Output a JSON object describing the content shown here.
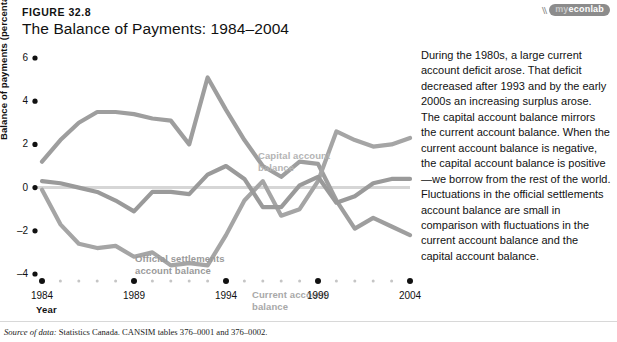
{
  "figure": {
    "number": "FIGURE 32.8",
    "title": "The Balance of Payments: 1984–2004"
  },
  "badge": {
    "mark": "\\\\\\\\",
    "prefix": "my",
    "word": "econlab"
  },
  "source": {
    "prefix": "Source of data:",
    "text": " Statistics Canada. CANSIM tables 376–0001 and 376–0002."
  },
  "side_text": "During the 1980s, a large current account deficit arose. That deficit decreased after 1993 and by the early 2000s an increasing surplus arose. The capital account balance mirrors the current account balance. When the current account balance is negative, the capital account balance is positive—we borrow from the rest of the world. Fluctuations in the official settlements account balance are small in comparison with fluctuations in the current account balance and the capital account balance.",
  "colors": {
    "capital": "#9e9e9e",
    "current": "#a5a5a5",
    "official": "#9a9a9a",
    "zero_line": "#d6d6d6",
    "tick_major": "#111111",
    "tick_minor": "#c5c5c5"
  },
  "chart_data": {
    "type": "line",
    "title": "The Balance of Payments: 1984–2004",
    "xlabel": "Year",
    "ylabel": "Balance of payments (percentage of GDP)",
    "xlim": [
      1984,
      2004
    ],
    "ylim": [
      -4,
      6
    ],
    "yticks": [
      6,
      4,
      2,
      0,
      -2,
      -4
    ],
    "xticks": [
      1984,
      1989,
      1994,
      1999,
      2004
    ],
    "grid": false,
    "legend": "inline-labels",
    "x": [
      1984,
      1985,
      1986,
      1987,
      1988,
      1989,
      1990,
      1991,
      1992,
      1993,
      1994,
      1995,
      1996,
      1997,
      1998,
      1999,
      2000,
      2001,
      2002,
      2003,
      2004
    ],
    "series": [
      {
        "name": "Capital account balance",
        "color": "#9e9e9e",
        "label_position": {
          "x": 258,
          "y": 106
        },
        "values": [
          1.2,
          2.2,
          3.0,
          3.5,
          3.5,
          3.4,
          3.2,
          3.1,
          2.0,
          5.1,
          3.6,
          2.2,
          1.0,
          0.5,
          1.2,
          1.1,
          -0.6,
          -1.9,
          -1.4,
          -1.8,
          -2.2
        ]
      },
      {
        "name": "Current account balance",
        "color": "#a5a5a5",
        "label_position": {
          "x": 252,
          "y": 245
        },
        "values": [
          -0.1,
          -1.7,
          -2.6,
          -2.8,
          -2.7,
          -3.2,
          -3.0,
          -3.6,
          -3.5,
          -3.6,
          -2.2,
          -0.6,
          0.3,
          -1.3,
          -1.0,
          0.3,
          2.6,
          2.2,
          1.9,
          2.0,
          2.3
        ]
      },
      {
        "name": "Official settlements account balance",
        "color": "#9a9a9a",
        "label_position": {
          "x": 135,
          "y": 209
        },
        "values": [
          0.3,
          0.2,
          0.0,
          -0.2,
          -0.6,
          -1.1,
          -0.2,
          -0.2,
          -0.3,
          0.6,
          1.0,
          0.4,
          -0.9,
          -0.9,
          0.1,
          0.5,
          -0.7,
          -0.4,
          0.2,
          0.4,
          0.4
        ]
      }
    ],
    "annotations": [
      {
        "text": "Capital account balance",
        "series": "Capital account balance"
      },
      {
        "text": "Official settlements account balance",
        "series": "Official settlements account balance"
      },
      {
        "text": "Current account balance",
        "series": "Current account balance"
      }
    ]
  }
}
